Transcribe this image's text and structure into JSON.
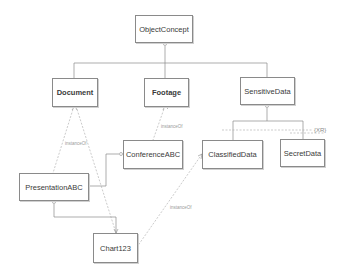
{
  "diagram": {
    "type": "uml-class-diagram",
    "nodes": {
      "object_concept": "ObjectConcept",
      "document": "Document",
      "footage": "Footage",
      "sensitive_data": "SensitiveData",
      "conference_abc": "ConferenceABC",
      "classified_data": "ClassifiedData",
      "secret_data": "SecretData",
      "presentation_abc": "PresentationABC",
      "chart123": "Chart123"
    },
    "edges": {
      "instance_of_document": "instanceOf",
      "instance_of_footage": "instanceOf",
      "instance_of_classified": "instanceOf"
    },
    "constraint": "{XR}",
    "colors": {
      "line": "#8a8a8a",
      "dashed_line": "#a8a8a8",
      "text": "#3a3a3a"
    }
  }
}
